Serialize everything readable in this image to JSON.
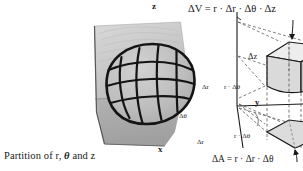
{
  "figure": {
    "title_text": "Partition of r, θ and z",
    "background": "#ffffff",
    "ink": "#1a1a1a"
  },
  "left_panel": {
    "name": "photograph-partition-of-cylindrical-solid",
    "caption": {
      "prefix": "Partition of r,",
      "theta": "θ",
      "suffix": "and z"
    },
    "description_objects": [
      "gray photographic plate",
      "wireframe barrel/ellipsoid mesh of curved grid lines",
      "shaded ground plane quadrilateral"
    ],
    "colors": {
      "plate_light": "#cfcfcf",
      "plate_mid": "#b4b4b4",
      "plate_dark": "#9a9a9a",
      "mesh": "#1a1a1a"
    }
  },
  "right_panel": {
    "name": "cylindrical-volume-element-diagram",
    "labels": {
      "volume_formula": "ΔV = r · Δr · Δθ · Δz",
      "area_formula": "ΔA = r · Δr · Δθ",
      "delta_z": "Δz",
      "delta_r_top": "Δr",
      "r_delta_theta_top": "r · Δθ",
      "delta_r_bottom": "Δr",
      "r_delta_theta_bottom": "r · Δθ",
      "delta_theta_angle": "Δθ"
    },
    "axes": {
      "z": "z",
      "y": "y",
      "x": "x"
    },
    "colors": {
      "solid_fill": "#d8d8d8",
      "solid_fill_light": "#ececec",
      "solid_fill_dark": "#c2c2c2",
      "outline": "#1a1a1a",
      "dashed": "#555555"
    }
  }
}
